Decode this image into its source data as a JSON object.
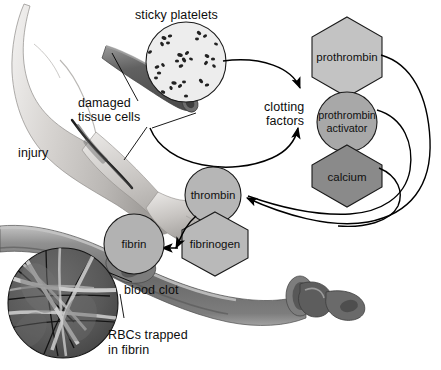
{
  "figure": {
    "background": "#ffffff"
  },
  "labels": {
    "sticky_platelets": "sticky platelets",
    "damaged_tissue_cells_l1": "damaged",
    "damaged_tissue_cells_l2": "tissue cells",
    "injury": "injury",
    "clotting_factors_l1": "clotting",
    "clotting_factors_l2": "factors",
    "blood_clot": "blood clot",
    "rbcs_trapped_l1": "RBCs trapped",
    "rbcs_trapped_l2": "in fibrin"
  },
  "nodes": [
    {
      "id": "prothrombin",
      "label": "prothrombin",
      "shape": "hexagon",
      "fill": "#c3c3c3"
    },
    {
      "id": "prothrombin-activator",
      "label_l1": "prothrombin",
      "label_l2": "activator",
      "shape": "circle",
      "fill": "#a8a8a8"
    },
    {
      "id": "calcium",
      "label": "calcium",
      "shape": "hexagon",
      "fill": "#8a8a8a"
    },
    {
      "id": "thrombin",
      "label": "thrombin",
      "shape": "circle",
      "fill": "#b6b6b6"
    },
    {
      "id": "fibrinogen",
      "label": "fibrinogen",
      "shape": "hexagon",
      "fill": "#b9b9b9"
    },
    {
      "id": "fibrin",
      "label": "fibrin",
      "shape": "circle",
      "fill": "#b2b2b2"
    }
  ],
  "colors": {
    "skin_light": "#e6e4e2",
    "skin_mid": "#c9c6c3",
    "skin_dark": "#9a9794",
    "vessel_dark": "#6d6d6d",
    "vessel_mid": "#8f8f8f",
    "vessel_light": "#bdbdbd",
    "clot_dark": "#565656",
    "platelet_fill": "#ececec",
    "platelet_dot": "#2a2a2a",
    "rbc_dark": "#5e5e5e",
    "fibrin_strand": "#d9d9d9",
    "line": "#000000",
    "text": "#0d0d0d"
  }
}
